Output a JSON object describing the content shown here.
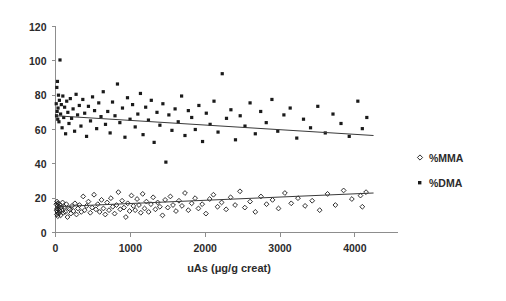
{
  "chart_data": {
    "type": "scatter",
    "title": "",
    "xlabel": "uAs (μg/g creat)",
    "ylabel": "",
    "xlim": [
      0,
      4550
    ],
    "ylim": [
      0,
      120
    ],
    "xticks": [
      0,
      1000,
      2000,
      3000,
      4000
    ],
    "xtick_labels": [
      "0",
      "1000",
      "2000",
      "3000",
      "4000"
    ],
    "yticks": [
      0,
      20,
      40,
      60,
      80,
      100,
      120
    ],
    "ytick_labels": [
      "0",
      "20",
      "40",
      "60",
      "80",
      "100",
      "120"
    ],
    "grid": false,
    "legend_position": "right",
    "series": [
      {
        "name": "%MMA",
        "marker": "open-diamond",
        "color": "#1a1a1a",
        "trendline": {
          "x0": 0,
          "y0": 15.0,
          "x1": 4250,
          "y1": 23.0
        },
        "points": [
          [
            10,
            16.5
          ],
          [
            15,
            13.0
          ],
          [
            18,
            10.5
          ],
          [
            20,
            18.0
          ],
          [
            22,
            14.0
          ],
          [
            25,
            12.0
          ],
          [
            28,
            15.5
          ],
          [
            30,
            9.5
          ],
          [
            35,
            17.0
          ],
          [
            38,
            13.5
          ],
          [
            42,
            11.0
          ],
          [
            48,
            15.0
          ],
          [
            55,
            12.5
          ],
          [
            60,
            16.0
          ],
          [
            68,
            10.0
          ],
          [
            75,
            14.5
          ],
          [
            85,
            13.0
          ],
          [
            95,
            17.5
          ],
          [
            105,
            11.5
          ],
          [
            118,
            15.0
          ],
          [
            130,
            12.0
          ],
          [
            145,
            16.5
          ],
          [
            160,
            9.0
          ],
          [
            175,
            14.0
          ],
          [
            190,
            13.5
          ],
          [
            205,
            11.0
          ],
          [
            220,
            15.5
          ],
          [
            240,
            12.5
          ],
          [
            260,
            17.0
          ],
          [
            280,
            10.5
          ],
          [
            300,
            14.0
          ],
          [
            320,
            16.0
          ],
          [
            345,
            12.0
          ],
          [
            370,
            21.0
          ],
          [
            390,
            13.0
          ],
          [
            415,
            15.5
          ],
          [
            440,
            18.0
          ],
          [
            465,
            11.5
          ],
          [
            490,
            14.5
          ],
          [
            515,
            22.0
          ],
          [
            540,
            13.5
          ],
          [
            565,
            16.5
          ],
          [
            590,
            12.0
          ],
          [
            615,
            19.0
          ],
          [
            640,
            14.0
          ],
          [
            665,
            10.5
          ],
          [
            690,
            17.5
          ],
          [
            715,
            13.0
          ],
          [
            740,
            20.0
          ],
          [
            765,
            15.0
          ],
          [
            790,
            11.0
          ],
          [
            815,
            16.0
          ],
          [
            840,
            23.5
          ],
          [
            865,
            13.5
          ],
          [
            890,
            18.5
          ],
          [
            915,
            14.5
          ],
          [
            940,
            9.0
          ],
          [
            965,
            17.0
          ],
          [
            990,
            12.5
          ],
          [
            1015,
            21.5
          ],
          [
            1040,
            15.5
          ],
          [
            1065,
            13.0
          ],
          [
            1090,
            19.5
          ],
          [
            1115,
            16.0
          ],
          [
            1140,
            11.5
          ],
          [
            1165,
            22.5
          ],
          [
            1190,
            14.0
          ],
          [
            1215,
            18.0
          ],
          [
            1245,
            12.0
          ],
          [
            1275,
            16.5
          ],
          [
            1305,
            20.5
          ],
          [
            1335,
            13.5
          ],
          [
            1365,
            17.5
          ],
          [
            1395,
            15.0
          ],
          [
            1430,
            10.0
          ],
          [
            1465,
            19.0
          ],
          [
            1500,
            14.5
          ],
          [
            1535,
            21.0
          ],
          [
            1570,
            16.0
          ],
          [
            1610,
            12.5
          ],
          [
            1650,
            18.5
          ],
          [
            1690,
            15.5
          ],
          [
            1730,
            23.0
          ],
          [
            1775,
            13.0
          ],
          [
            1820,
            17.0
          ],
          [
            1865,
            20.0
          ],
          [
            1910,
            14.0
          ],
          [
            1960,
            16.5
          ],
          [
            2010,
            11.0
          ],
          [
            2060,
            19.5
          ],
          [
            2110,
            22.0
          ],
          [
            2165,
            15.0
          ],
          [
            2220,
            17.5
          ],
          [
            2280,
            13.5
          ],
          [
            2340,
            20.5
          ],
          [
            2400,
            16.0
          ],
          [
            2465,
            24.0
          ],
          [
            2530,
            14.5
          ],
          [
            2600,
            18.0
          ],
          [
            2670,
            12.0
          ],
          [
            2745,
            21.0
          ],
          [
            2820,
            16.5
          ],
          [
            2900,
            19.0
          ],
          [
            2980,
            14.0
          ],
          [
            3065,
            23.0
          ],
          [
            3150,
            17.0
          ],
          [
            3240,
            20.0
          ],
          [
            3335,
            15.5
          ],
          [
            3430,
            18.5
          ],
          [
            3530,
            13.0
          ],
          [
            3635,
            22.5
          ],
          [
            3740,
            16.0
          ],
          [
            3850,
            24.5
          ],
          [
            3960,
            19.5
          ],
          [
            4075,
            21.5
          ],
          [
            4100,
            15.0
          ],
          [
            4150,
            23.5
          ]
        ]
      },
      {
        "name": "%DMA",
        "marker": "filled-square",
        "color": "#1a1a1a",
        "trendline": {
          "x0": 0,
          "y0": 68.0,
          "x1": 4250,
          "y1": 56.5
        },
        "points": [
          [
            10,
            75.0
          ],
          [
            14,
            68.0
          ],
          [
            18,
            84.5
          ],
          [
            22,
            70.5
          ],
          [
            26,
            88.0
          ],
          [
            30,
            66.0
          ],
          [
            34,
            72.5
          ],
          [
            40,
            80.0
          ],
          [
            46,
            64.5
          ],
          [
            52,
            77.0
          ],
          [
            60,
            100.5
          ],
          [
            68,
            69.0
          ],
          [
            78,
            74.5
          ],
          [
            88,
            61.0
          ],
          [
            98,
            79.5
          ],
          [
            110,
            67.0
          ],
          [
            122,
            73.0
          ],
          [
            135,
            57.5
          ],
          [
            150,
            76.5
          ],
          [
            165,
            70.0
          ],
          [
            180,
            63.5
          ],
          [
            198,
            78.0
          ],
          [
            215,
            66.5
          ],
          [
            235,
            72.0
          ],
          [
            255,
            59.0
          ],
          [
            275,
            80.5
          ],
          [
            295,
            68.5
          ],
          [
            318,
            74.0
          ],
          [
            340,
            62.0
          ],
          [
            365,
            77.5
          ],
          [
            390,
            69.5
          ],
          [
            415,
            56.0
          ],
          [
            440,
            73.5
          ],
          [
            468,
            65.0
          ],
          [
            495,
            79.0
          ],
          [
            522,
            71.0
          ],
          [
            550,
            60.5
          ],
          [
            578,
            75.5
          ],
          [
            608,
            67.5
          ],
          [
            638,
            82.0
          ],
          [
            668,
            63.0
          ],
          [
            698,
            70.5
          ],
          [
            730,
            58.0
          ],
          [
            762,
            76.0
          ],
          [
            795,
            68.0
          ],
          [
            828,
            86.5
          ],
          [
            860,
            64.0
          ],
          [
            895,
            72.5
          ],
          [
            928,
            55.5
          ],
          [
            962,
            78.5
          ],
          [
            996,
            66.0
          ],
          [
            1030,
            74.5
          ],
          [
            1065,
            61.5
          ],
          [
            1100,
            69.0
          ],
          [
            1135,
            81.0
          ],
          [
            1170,
            57.0
          ],
          [
            1205,
            73.0
          ],
          [
            1242,
            65.5
          ],
          [
            1280,
            77.0
          ],
          [
            1318,
            52.5
          ],
          [
            1356,
            70.0
          ],
          [
            1395,
            62.5
          ],
          [
            1435,
            75.0
          ],
          [
            1475,
            41.0
          ],
          [
            1515,
            68.5
          ],
          [
            1556,
            59.5
          ],
          [
            1598,
            72.0
          ],
          [
            1640,
            64.5
          ],
          [
            1685,
            79.5
          ],
          [
            1730,
            56.5
          ],
          [
            1775,
            71.0
          ],
          [
            1820,
            67.0
          ],
          [
            1868,
            60.0
          ],
          [
            1916,
            74.0
          ],
          [
            1965,
            53.0
          ],
          [
            2015,
            69.5
          ],
          [
            2066,
            63.0
          ],
          [
            2118,
            76.5
          ],
          [
            2172,
            58.5
          ],
          [
            2228,
            92.5
          ],
          [
            2285,
            66.5
          ],
          [
            2344,
            71.5
          ],
          [
            2405,
            54.0
          ],
          [
            2468,
            68.0
          ],
          [
            2532,
            62.0
          ],
          [
            2600,
            75.5
          ],
          [
            2670,
            57.5
          ],
          [
            2742,
            70.5
          ],
          [
            2816,
            64.0
          ],
          [
            2892,
            77.5
          ],
          [
            2970,
            59.0
          ],
          [
            3052,
            68.5
          ],
          [
            3136,
            72.5
          ],
          [
            3224,
            55.0
          ],
          [
            3314,
            66.0
          ],
          [
            3408,
            61.0
          ],
          [
            3505,
            73.5
          ],
          [
            3605,
            58.0
          ],
          [
            3708,
            69.0
          ],
          [
            3815,
            63.5
          ],
          [
            3925,
            56.0
          ],
          [
            4040,
            76.5
          ],
          [
            4100,
            60.5
          ],
          [
            4160,
            67.0
          ]
        ]
      }
    ]
  },
  "legend": {
    "items": [
      {
        "label": "%MMA",
        "marker": "open-diamond"
      },
      {
        "label": "%DMA",
        "marker": "filled-square"
      }
    ]
  },
  "axes": {
    "x_title": "uAs (μg/g creat)"
  }
}
